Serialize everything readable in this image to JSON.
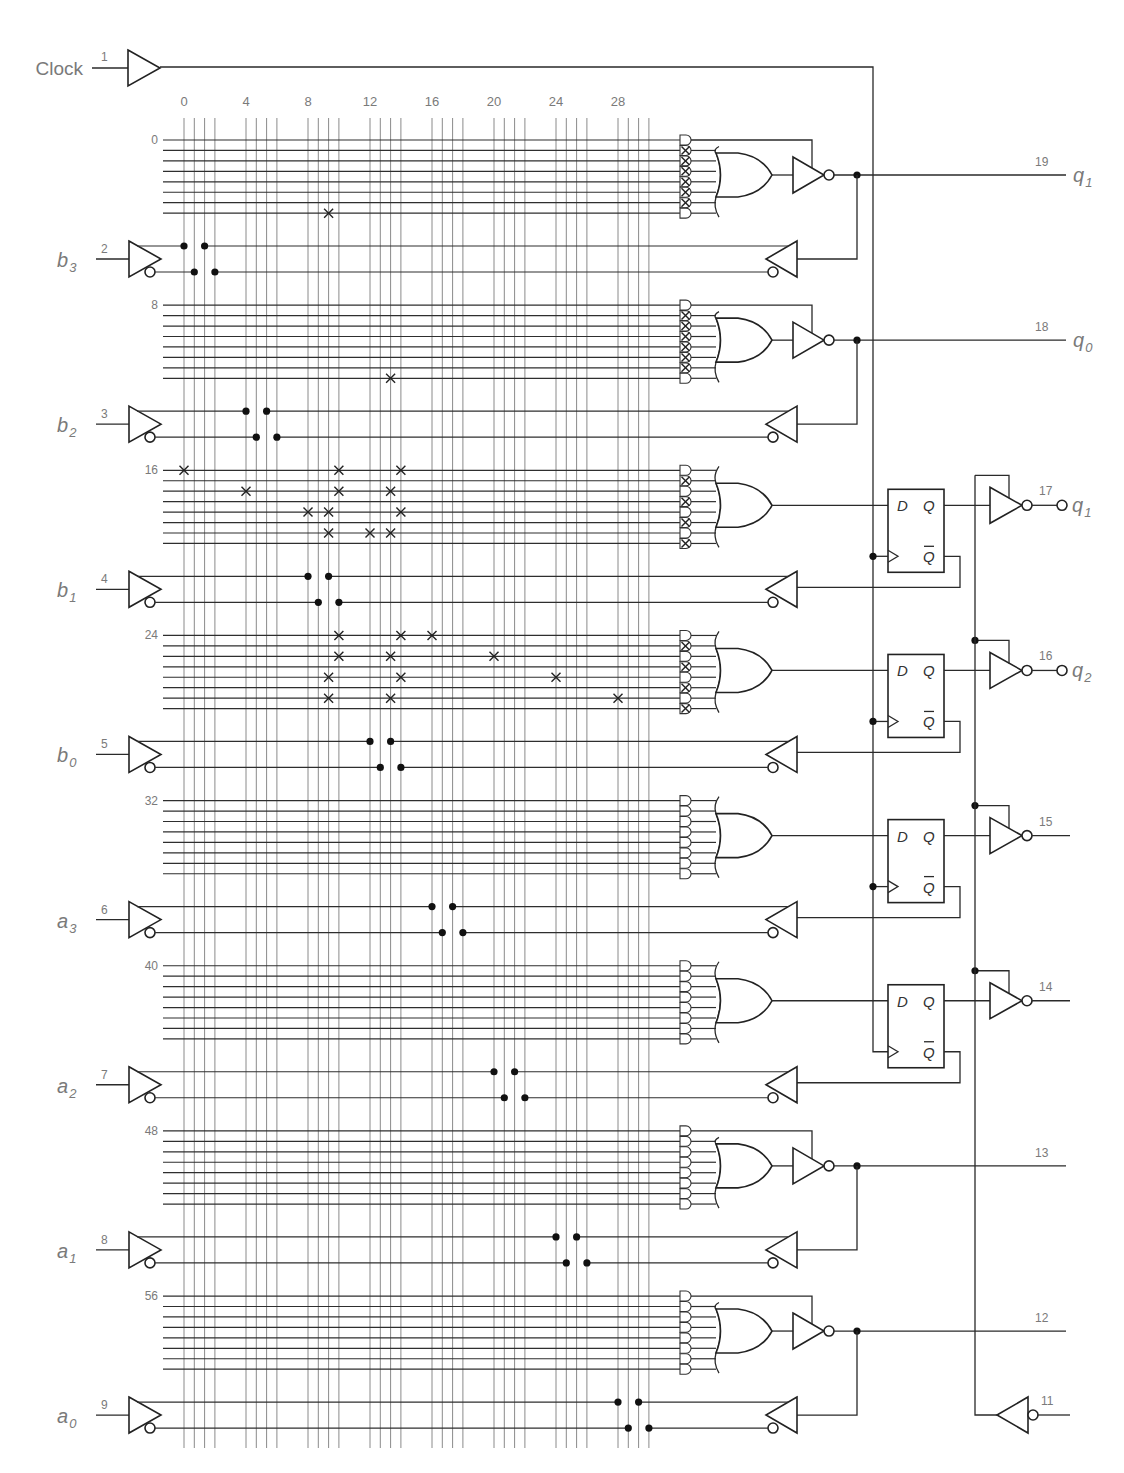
{
  "clock": {
    "label": "Clock",
    "pin": "1"
  },
  "inputs": [
    {
      "name": "b",
      "sub": "3",
      "pin": "2"
    },
    {
      "name": "b",
      "sub": "2",
      "pin": "3"
    },
    {
      "name": "b",
      "sub": "1",
      "pin": "4"
    },
    {
      "name": "b",
      "sub": "0",
      "pin": "5"
    },
    {
      "name": "a",
      "sub": "3",
      "pin": "6"
    },
    {
      "name": "a",
      "sub": "2",
      "pin": "7"
    },
    {
      "name": "a",
      "sub": "1",
      "pin": "8"
    },
    {
      "name": "a",
      "sub": "0",
      "pin": "9"
    }
  ],
  "column_labels": [
    "0",
    "4",
    "8",
    "12",
    "16",
    "20",
    "24",
    "28"
  ],
  "row_labels": [
    "0",
    "8",
    "16",
    "24",
    "32",
    "40",
    "48",
    "56"
  ],
  "outputs": [
    {
      "pin": "19",
      "type": "combinational",
      "name": "q",
      "sub": "1"
    },
    {
      "pin": "18",
      "type": "combinational",
      "name": "q",
      "sub": "0"
    },
    {
      "pin": "17",
      "type": "registered",
      "name": "q",
      "sub": "1"
    },
    {
      "pin": "16",
      "type": "registered",
      "name": "q",
      "sub": "2"
    },
    {
      "pin": "15",
      "type": "registered",
      "name": "",
      "sub": ""
    },
    {
      "pin": "14",
      "type": "registered",
      "name": "",
      "sub": ""
    },
    {
      "pin": "13",
      "type": "combinational",
      "name": "",
      "sub": ""
    },
    {
      "pin": "12",
      "type": "combinational",
      "name": "",
      "sub": ""
    }
  ],
  "output_enable": {
    "pin": "11"
  },
  "flip_flop_labels": {
    "d": "D",
    "q": "Q",
    "qbar": "Q"
  },
  "fuses": [
    [
      7,
      10
    ],
    [
      15,
      14
    ],
    [
      16,
      0
    ],
    [
      16,
      11
    ],
    [
      16,
      15
    ],
    [
      18,
      4
    ],
    [
      18,
      11
    ],
    [
      18,
      14
    ],
    [
      20,
      8
    ],
    [
      20,
      10
    ],
    [
      20,
      15
    ],
    [
      22,
      10
    ],
    [
      22,
      12
    ],
    [
      22,
      14
    ],
    [
      24,
      11
    ],
    [
      24,
      15
    ],
    [
      24,
      16
    ],
    [
      26,
      11
    ],
    [
      26,
      14
    ],
    [
      26,
      20
    ],
    [
      28,
      10
    ],
    [
      28,
      15
    ],
    [
      28,
      24
    ],
    [
      30,
      10
    ],
    [
      30,
      14
    ],
    [
      30,
      28
    ]
  ],
  "and_gates_all_fuses_intact": [
    1,
    2,
    3,
    4,
    5,
    6,
    9,
    10,
    11,
    12,
    13,
    14,
    17,
    19,
    21,
    23,
    25,
    27,
    29,
    31
  ]
}
